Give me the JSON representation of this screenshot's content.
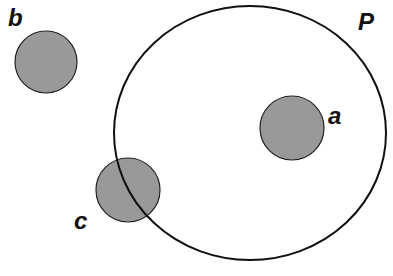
{
  "diagram": {
    "region": {
      "label": "P",
      "cx": 250,
      "cy": 133,
      "rx": 136,
      "ry": 127,
      "stroke": "#111111"
    },
    "circles": [
      {
        "label": "a",
        "cx": 292,
        "cy": 128,
        "r": 32,
        "label_x": 328,
        "label_y": 124,
        "fill": "#999999"
      },
      {
        "label": "b",
        "cx": 46,
        "cy": 62,
        "r": 31,
        "label_x": 8,
        "label_y": 26,
        "fill": "#999999"
      },
      {
        "label": "c",
        "cx": 128,
        "cy": 190,
        "r": 32,
        "label_x": 74,
        "label_y": 229,
        "fill": "#999999"
      }
    ],
    "region_label_pos": {
      "x": 358,
      "y": 30
    }
  }
}
